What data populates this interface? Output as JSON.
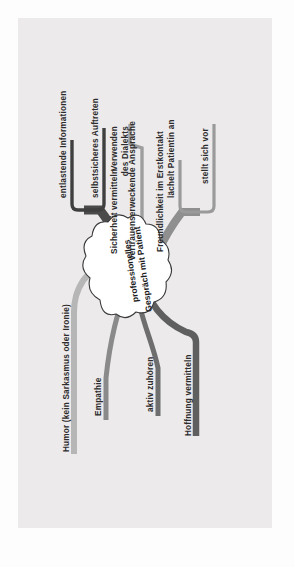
{
  "document": {
    "type": "mind-map",
    "language": "de",
    "background_color": "#eceaea",
    "page_color": "#fdfdfd",
    "orientation": "rotated-90-ccw"
  },
  "center": {
    "line1": "professionelles",
    "line2": "Gespräch mit Patient",
    "shape": "cloud",
    "fill": "#ffffff",
    "stroke": "#3a3a3a"
  },
  "branches": [
    {
      "id": "freundlichkeit",
      "label": "Freundlichkeit im Erstkontakt",
      "color": "#8f8f8f",
      "children": [
        {
          "id": "laechelt",
          "label": "lächelt Patientin an",
          "color": "#9a9a9a"
        },
        {
          "id": "stellt-sich-vor",
          "label": "stellt sich vor",
          "color": "#9a9a9a"
        }
      ]
    },
    {
      "id": "vertrauen",
      "label": "vertrauenserweckende Ansprache",
      "color": "#9e9e9e",
      "children": [
        {
          "id": "dialekt",
          "label": "Verwenden des Dialekts",
          "color": "#9e9e9e"
        }
      ]
    },
    {
      "id": "sicherheit",
      "label": "Sicherheit vermitteln",
      "color": "#4a4a4a",
      "children": [
        {
          "id": "entlastende-infos",
          "label": "entlastende Informationen",
          "color": "#3f3f3f"
        },
        {
          "id": "selbstsicher",
          "label": "selbstsicheres Auftreten",
          "color": "#3f3f3f"
        }
      ]
    },
    {
      "id": "humor",
      "label": "Humor (kein Sarkasmus oder Ironie)",
      "color": "#b6b6b6",
      "children": []
    },
    {
      "id": "empathie",
      "label": "Empathie",
      "color": "#8a8a8a",
      "children": []
    },
    {
      "id": "aktiv-zuhoeren",
      "label": "aktiv zuhören",
      "color": "#6e6e6e",
      "children": []
    },
    {
      "id": "hoffnung",
      "label": "Hoffnung vermitteln",
      "color": "#5f5f5f",
      "children": []
    }
  ],
  "sublabels": {
    "dialekt_line1": "Verwenden",
    "dialekt_line2": "des Dialekts"
  }
}
